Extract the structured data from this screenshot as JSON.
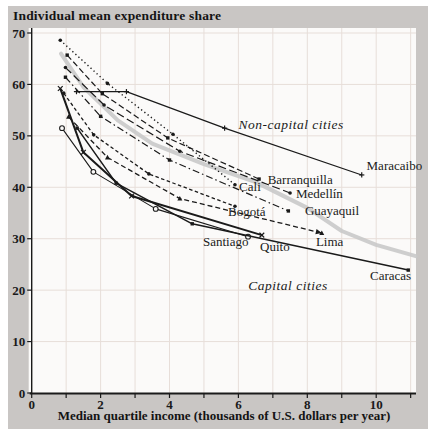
{
  "figure": {
    "title": "Individual mean expenditure share",
    "x_caption": "Median quartile income (thousands of U.S. dollars per year)",
    "colors": {
      "page_bg": "#ffffff",
      "panel_bg": "#c9c6c4",
      "plot_bg": "#fbfaf9",
      "grid": "#e7ded9",
      "ink": "#1a1a1a",
      "trend": "#c9c9c9"
    }
  },
  "chart_data": {
    "type": "line",
    "title": "Individual mean expenditure share",
    "xlabel": "Median quartile income (thousands of U.S. dollars per year)",
    "ylabel": "Individual mean expenditure share (%)",
    "xlim": [
      0,
      11.15
    ],
    "ylim": [
      0,
      70
    ],
    "xticks": [
      0,
      2,
      4,
      6,
      8,
      10
    ],
    "xgridlines": [
      1,
      2,
      3,
      4,
      5,
      6,
      7,
      8,
      9,
      10,
      11
    ],
    "yticks": [
      0,
      10,
      20,
      30,
      40,
      50,
      60,
      70
    ],
    "grid": true,
    "legend_position": "none",
    "annotations": [
      {
        "text": "Non-capital cities",
        "x": 7.53,
        "y": 51.3,
        "style": "italic",
        "anchor": "middle"
      },
      {
        "text": "Capital cities",
        "x": 7.44,
        "y": 20.0,
        "style": "italic",
        "anchor": "middle"
      }
    ],
    "trend_curve": {
      "note": "thick light-gray overall trend curve",
      "points": [
        [
          0.85,
          66
        ],
        [
          1.5,
          59.5
        ],
        [
          2.5,
          53
        ],
        [
          3.5,
          48.5
        ],
        [
          5,
          44.5
        ],
        [
          6.5,
          41
        ],
        [
          8,
          36
        ],
        [
          9,
          31.5
        ],
        [
          10,
          28.8
        ],
        [
          11.15,
          26.6
        ]
      ]
    },
    "series": [
      {
        "name": "Maracaibo",
        "group": "non-capital",
        "dash": "",
        "width": 1.2,
        "marker": "plus",
        "points": [
          [
            1.3,
            58.6
          ],
          [
            2.75,
            58.6
          ],
          [
            5.6,
            51.5
          ],
          [
            9.58,
            42.4
          ]
        ],
        "label": {
          "x": 9.72,
          "y": 43.4,
          "anchor": "start"
        }
      },
      {
        "name": "Barranquilla",
        "group": "non-capital",
        "dash": "6,3",
        "width": 1.2,
        "marker": "square",
        "points": [
          [
            1.03,
            65.7
          ],
          [
            2.05,
            58.2
          ],
          [
            3.95,
            49.6
          ],
          [
            6.6,
            41.6
          ]
        ],
        "label": {
          "x": 6.85,
          "y": 40.6,
          "anchor": "start"
        }
      },
      {
        "name": "Cali",
        "group": "non-capital",
        "dash": "1.3,2.8",
        "width": 1.4,
        "marker": "circle",
        "points": [
          [
            0.83,
            68.6
          ],
          [
            2.2,
            60.2
          ],
          [
            4.1,
            50.3
          ],
          [
            5.9,
            40.5
          ]
        ],
        "label": {
          "x": 6.02,
          "y": 39.2,
          "anchor": "start"
        }
      },
      {
        "name": "Medellín",
        "group": "non-capital",
        "dash": "8,3.5",
        "width": 1.2,
        "marker": "circle",
        "points": [
          [
            0.98,
            63.3
          ],
          [
            2.1,
            56.0
          ],
          [
            4.3,
            47.0
          ],
          [
            7.5,
            38.9
          ]
        ],
        "label": {
          "x": 7.67,
          "y": 38.0,
          "anchor": "start"
        }
      },
      {
        "name": "Guayaquil",
        "group": "non-capital",
        "dash": "7,3,1.5,3",
        "width": 1.2,
        "marker": "square",
        "points": [
          [
            0.98,
            61.4
          ],
          [
            2.0,
            53.8
          ],
          [
            4.0,
            45.3
          ],
          [
            7.45,
            35.4
          ]
        ],
        "label": {
          "x": 7.93,
          "y": 34.7,
          "anchor": "start"
        }
      },
      {
        "name": "Bogotá",
        "group": "capital",
        "dash": "3.5,2.5",
        "width": 1.3,
        "marker": "circle",
        "points": [
          [
            0.93,
            58.3
          ],
          [
            1.8,
            50.2
          ],
          [
            3.4,
            42.6
          ],
          [
            5.9,
            36.3
          ]
        ],
        "label": {
          "x": 5.7,
          "y": 34.5,
          "anchor": "start"
        }
      },
      {
        "name": "Santiago",
        "group": "capital",
        "dash": "",
        "width": 1.1,
        "marker": "open-circle",
        "points": [
          [
            0.88,
            51.5
          ],
          [
            1.79,
            43.0
          ],
          [
            3.6,
            35.8
          ],
          [
            6.28,
            30.4
          ]
        ],
        "label": {
          "x": 4.97,
          "y": 28.5,
          "anchor": "start"
        }
      },
      {
        "name": "Quito",
        "group": "capital",
        "dash": "",
        "width": 2.0,
        "marker": "x",
        "points": [
          [
            0.83,
            59.2
          ],
          [
            1.5,
            46.8
          ],
          [
            2.9,
            38.3
          ],
          [
            6.68,
            30.7
          ]
        ],
        "label": {
          "x": 6.63,
          "y": 27.7,
          "anchor": "start"
        }
      },
      {
        "name": "Lima",
        "group": "capital",
        "dash": "5,3",
        "width": 1.3,
        "marker": "triangle",
        "arrow_end": true,
        "points": [
          [
            1.07,
            53.7
          ],
          [
            2.2,
            45.8
          ],
          [
            4.3,
            37.8
          ],
          [
            8.42,
            31.1
          ]
        ],
        "label": {
          "x": 8.25,
          "y": 28.5,
          "anchor": "start"
        }
      },
      {
        "name": "Caracas",
        "group": "capital",
        "dash": "",
        "width": 1.5,
        "marker": "square",
        "points": [
          [
            1.32,
            51.5
          ],
          [
            2.45,
            40.8
          ],
          [
            4.66,
            32.9
          ],
          [
            10.93,
            23.9
          ]
        ],
        "label": {
          "x": 9.82,
          "y": 21.9,
          "anchor": "start"
        }
      }
    ]
  }
}
